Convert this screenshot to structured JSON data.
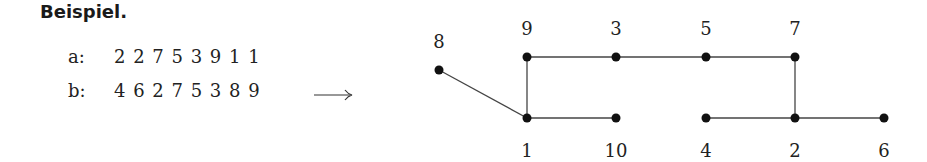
{
  "heading": "Beispiel.",
  "sequences": [
    {
      "label": "a:",
      "values": "2 2 7 5 3 9 1 1"
    },
    {
      "label": "b:",
      "values": "4 6 2 7 5 3 8 9"
    }
  ],
  "arrow": "⟶",
  "graph": {
    "nodes": [
      {
        "id": "8",
        "x": 439,
        "y": 70,
        "label_x": 439,
        "label_y": 48
      },
      {
        "id": "9",
        "x": 527,
        "y": 57,
        "label_x": 527,
        "label_y": 35
      },
      {
        "id": "3",
        "x": 616,
        "y": 57,
        "label_x": 616,
        "label_y": 35
      },
      {
        "id": "5",
        "x": 706,
        "y": 57,
        "label_x": 706,
        "label_y": 35
      },
      {
        "id": "7",
        "x": 795,
        "y": 57,
        "label_x": 795,
        "label_y": 35
      },
      {
        "id": "1",
        "x": 527,
        "y": 118,
        "label_x": 527,
        "label_y": 157
      },
      {
        "id": "10",
        "x": 616,
        "y": 118,
        "label_x": 616,
        "label_y": 157
      },
      {
        "id": "4",
        "x": 706,
        "y": 118,
        "label_x": 706,
        "label_y": 157
      },
      {
        "id": "2",
        "x": 795,
        "y": 118,
        "label_x": 795,
        "label_y": 157
      },
      {
        "id": "6",
        "x": 884,
        "y": 118,
        "label_x": 884,
        "label_y": 157
      }
    ],
    "edges": [
      [
        "8",
        "1"
      ],
      [
        "9",
        "1"
      ],
      [
        "9",
        "3"
      ],
      [
        "3",
        "5"
      ],
      [
        "5",
        "7"
      ],
      [
        "7",
        "2"
      ],
      [
        "1",
        "10"
      ],
      [
        "4",
        "2"
      ],
      [
        "2",
        "6"
      ]
    ]
  }
}
